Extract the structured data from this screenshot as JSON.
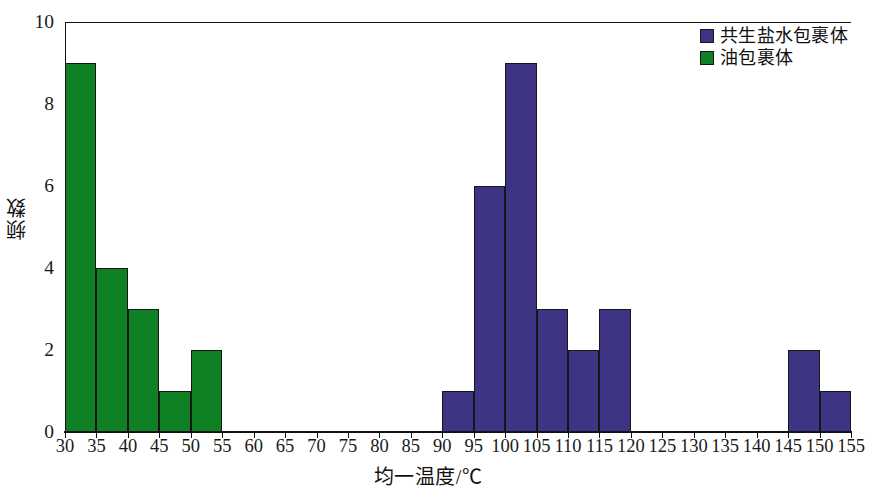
{
  "chart_data": {
    "type": "bar",
    "title": "",
    "subtitle": "",
    "xlabel": "均一温度/℃",
    "ylabel": "频数",
    "xlim": [
      30,
      155
    ],
    "ylim": [
      0,
      10
    ],
    "xticks": [
      30,
      35,
      40,
      45,
      50,
      55,
      60,
      65,
      70,
      75,
      80,
      85,
      90,
      95,
      100,
      105,
      110,
      115,
      120,
      125,
      130,
      135,
      140,
      145,
      150,
      155
    ],
    "yticks": [
      0,
      2,
      4,
      6,
      8,
      10
    ],
    "xtick_labels": [
      "30",
      "35",
      "40",
      "45",
      "50",
      "55",
      "60",
      "65",
      "70",
      "75",
      "80",
      "85",
      "90",
      "95",
      "100",
      "105",
      "110",
      "115",
      "120",
      "125",
      "130",
      "135",
      "140",
      "145",
      "150",
      "155"
    ],
    "ytick_labels": [
      "0",
      "2",
      "4",
      "6",
      "8",
      "10"
    ],
    "bin_width": 5,
    "grid": false,
    "legend_position": "top-right",
    "series": [
      {
        "name": "共生盐水包裹体",
        "color": "#3d3483",
        "bins": [
          {
            "x0": 90,
            "x1": 95,
            "value": 1
          },
          {
            "x0": 95,
            "x1": 100,
            "value": 6
          },
          {
            "x0": 100,
            "x1": 105,
            "value": 9
          },
          {
            "x0": 105,
            "x1": 110,
            "value": 3
          },
          {
            "x0": 110,
            "x1": 115,
            "value": 2
          },
          {
            "x0": 115,
            "x1": 120,
            "value": 3
          },
          {
            "x0": 145,
            "x1": 150,
            "value": 2
          },
          {
            "x0": 150,
            "x1": 155,
            "value": 1
          }
        ]
      },
      {
        "name": "油包裹体",
        "color": "#0f8024",
        "bins": [
          {
            "x0": 30,
            "x1": 35,
            "value": 9
          },
          {
            "x0": 35,
            "x1": 40,
            "value": 4
          },
          {
            "x0": 40,
            "x1": 45,
            "value": 3
          },
          {
            "x0": 45,
            "x1": 50,
            "value": 1
          },
          {
            "x0": 50,
            "x1": 55,
            "value": 2
          }
        ]
      }
    ]
  },
  "legend": {
    "items": [
      {
        "label": "共生盐水包裹体",
        "color": "#3d3483"
      },
      {
        "label": "油包裹体",
        "color": "#0f8024"
      }
    ]
  },
  "axes": {
    "x_title": "均一温度/℃",
    "y_title": "频数"
  }
}
